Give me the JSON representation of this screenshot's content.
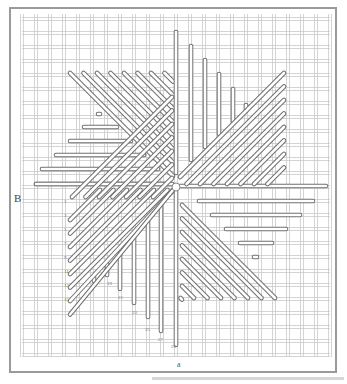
{
  "figure": {
    "type": "needlepoint stitch diagram",
    "side_label": "B",
    "bottom_caption": "a",
    "center": [
      176,
      187
    ],
    "grid": {
      "left": 22,
      "right": 330,
      "top": 14,
      "bottom": 357,
      "pitch": 14,
      "line_color": "#c9c9c9"
    },
    "frame": {
      "left": 10,
      "top": 8,
      "right": 336,
      "bottom": 372,
      "color": "#9a9a9a"
    },
    "stitch_color": "#6f6f6f",
    "row_numbers": [
      "1",
      "3",
      "5",
      "7",
      "9",
      "11",
      "13",
      "15"
    ],
    "vertical_stitch_numbers": [
      "19",
      "21",
      "23",
      "25",
      "27",
      "29"
    ]
  }
}
